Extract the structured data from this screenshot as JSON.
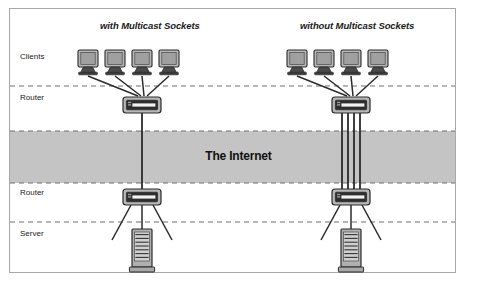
{
  "figure": {
    "title_left": "with Multicast Sockets",
    "title_right": "without Multicast Sockets",
    "internet_band_label": "The Internet",
    "row_labels": {
      "clients": "Clients",
      "router_top": "Router",
      "router_bottom": "Router",
      "server": "Server"
    },
    "colors": {
      "border": "#a8a8a8",
      "background": "#ffffff",
      "band_fill": "#c4c4c4",
      "dashed_line": "#6e6e6e",
      "link_line": "#2b2b2b",
      "device_body": "#b5b5b5",
      "device_dark": "#3a3a3a",
      "device_outline": "#2b2b2b",
      "text": "#1a1a1a"
    },
    "diagram": {
      "type": "network-topology",
      "left_panel": {
        "name": "with-multicast-sockets",
        "client_count": 4,
        "router_top_count": 1,
        "router_bottom_count": 1,
        "server_count": 1,
        "internet_link_count": 1,
        "description": "Four clients converge on one router; a single link crosses The Internet to the lower router, which fans out to the server."
      },
      "right_panel": {
        "name": "without-multicast-sockets",
        "client_count": 4,
        "router_top_count": 1,
        "router_bottom_count": 1,
        "server_count": 1,
        "internet_link_count": 4,
        "description": "Four clients converge on one router; four parallel links cross The Internet to the lower router, which fans out to the server."
      },
      "bands": {
        "internet_top_y": 131,
        "internet_bottom_y": 183,
        "divider_y": [
          86,
          131,
          183,
          222
        ]
      }
    }
  }
}
